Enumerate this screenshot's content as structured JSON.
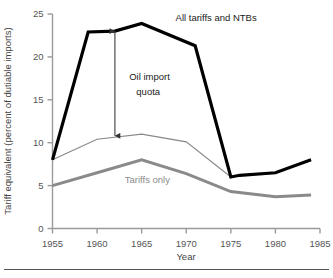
{
  "chart_data": {
    "type": "line",
    "title": "",
    "xlabel": "Year",
    "ylabel": "Tariff equivalent (percent of dutiable imports)",
    "xlim": [
      1955,
      1985
    ],
    "ylim": [
      0,
      25
    ],
    "xticks": [
      "1955",
      "1960",
      "1965",
      "1970",
      "1975",
      "1980",
      "1985"
    ],
    "yticks": [
      "0",
      "5",
      "10",
      "15",
      "20",
      "25"
    ],
    "grid": false,
    "legend": "inline-annotations",
    "series": [
      {
        "name": "All tariffs and NTBs",
        "color": "#000000",
        "width": 3.2,
        "x": [
          1955,
          1959,
          1962,
          1965,
          1971,
          1975,
          1976,
          1980,
          1984
        ],
        "values": [
          8.0,
          22.9,
          23.0,
          23.9,
          21.3,
          6.0,
          6.2,
          6.5,
          8.0
        ]
      },
      {
        "name": "Tariffs and non-oil NTBs",
        "color": "#888888",
        "width": 1.1,
        "x": [
          1955,
          1960,
          1965,
          1970,
          1975
        ],
        "values": [
          8.0,
          10.4,
          11.0,
          10.1,
          6.0
        ]
      },
      {
        "name": "Tariffs only",
        "color": "#8a8a8a",
        "width": 3.0,
        "x": [
          1955,
          1960,
          1965,
          1970,
          1975,
          1980,
          1984
        ],
        "values": [
          5.0,
          6.5,
          8.0,
          6.4,
          4.3,
          3.7,
          3.9
        ]
      }
    ],
    "annotations": [
      {
        "id": "all-tariffs-ntbs",
        "text": "All tariffs and NTBs",
        "color": "#1a1a1a",
        "x": 1968.8,
        "y": 24.2
      },
      {
        "id": "oil-import-quota-line1",
        "text": "Oil import",
        "color": "#1a1a1a",
        "x": 1963.6,
        "y": 17.3
      },
      {
        "id": "oil-import-quota-line2",
        "text": "quota",
        "color": "#1a1a1a",
        "x": 1964.4,
        "y": 15.6
      },
      {
        "id": "tariffs-only",
        "text": "Tariffs only",
        "color": "#8a8a8a",
        "x": 1963.1,
        "y": 5.3
      }
    ],
    "arrow": {
      "id": "oil-import-quota-arrow",
      "x": 1962.0,
      "y_top": 23.0,
      "y_bottom": 10.8,
      "double_headed": true,
      "color": "#444444"
    }
  }
}
